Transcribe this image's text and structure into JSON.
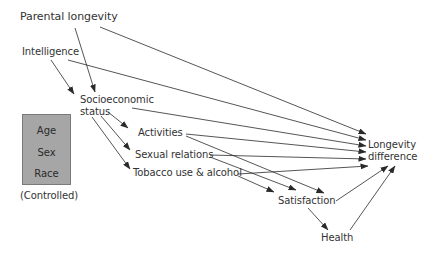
{
  "diagram": {
    "type": "path-diagram",
    "nodes": {
      "parental_longevity": "Parental longevity",
      "intelligence": "Intelligence",
      "ses_line1": "Socioeconomic",
      "ses_line2": "status",
      "activities": "Activities",
      "sexual_relations": "Sexual relations",
      "tobacco": "Tobacco use & alcohol",
      "longevity_line1": "Longevity",
      "longevity_line2": "difference",
      "satisfaction": "Satisfaction",
      "health": "Health"
    },
    "controlled_box": {
      "items": [
        "Age",
        "Sex",
        "Race"
      ],
      "caption": "(Controlled)",
      "fill": "#a6a6a6"
    },
    "edges": [
      {
        "from": "Parental longevity",
        "to": "Longevity difference"
      },
      {
        "from": "Parental longevity",
        "to": "Socioeconomic status"
      },
      {
        "from": "Intelligence",
        "to": "Socioeconomic status"
      },
      {
        "from": "Intelligence",
        "to": "Longevity difference"
      },
      {
        "from": "Socioeconomic status",
        "to": "Longevity difference"
      },
      {
        "from": "Socioeconomic status",
        "to": "Activities"
      },
      {
        "from": "Socioeconomic status",
        "to": "Sexual relations"
      },
      {
        "from": "Socioeconomic status",
        "to": "Tobacco use & alcohol"
      },
      {
        "from": "Activities",
        "to": "Longevity difference"
      },
      {
        "from": "Activities",
        "to": "Satisfaction"
      },
      {
        "from": "Sexual relations",
        "to": "Longevity difference"
      },
      {
        "from": "Sexual relations",
        "to": "Satisfaction"
      },
      {
        "from": "Tobacco use & alcohol",
        "to": "Longevity difference"
      },
      {
        "from": "Tobacco use & alcohol",
        "to": "Satisfaction"
      },
      {
        "from": "Satisfaction",
        "to": "Longevity difference"
      },
      {
        "from": "Satisfaction",
        "to": "Health"
      },
      {
        "from": "Health",
        "to": "Longevity difference"
      }
    ],
    "line_color": "#2a2a2a"
  }
}
